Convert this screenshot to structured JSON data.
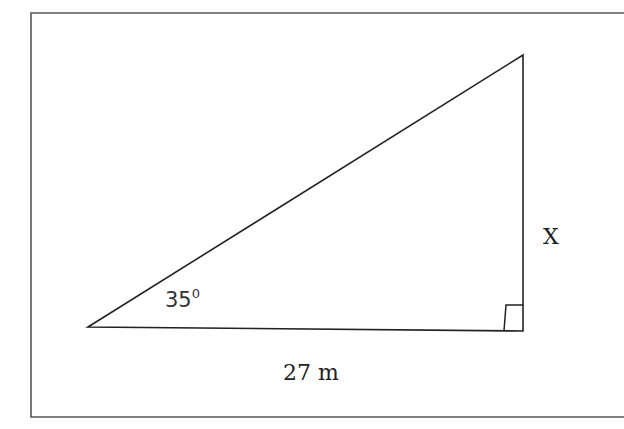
{
  "diagram": {
    "type": "right-triangle",
    "frame": {
      "stroke": "#555555"
    },
    "stroke_color": "#222222",
    "vertices": {
      "left": [
        88,
        327
      ],
      "top_right": [
        523,
        55
      ],
      "bottom_right": [
        523,
        331
      ]
    },
    "labels": {
      "angle": "35",
      "angle_sup": "0",
      "base": "27 m",
      "height": "X"
    }
  }
}
